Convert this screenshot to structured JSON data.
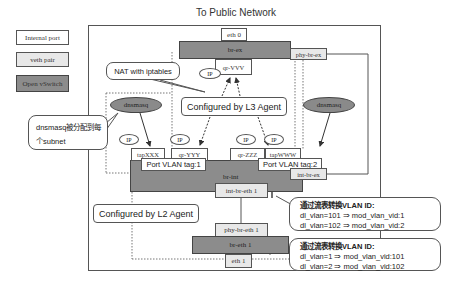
{
  "title": "To Public Network",
  "legend": [
    {
      "label": "Internal   port",
      "kind": "internal"
    },
    {
      "label": "veth   pair",
      "kind": "veth"
    },
    {
      "label": "Open   vSwitch",
      "kind": "ovs"
    }
  ],
  "colors": {
    "ovs": "#8c8c8c",
    "veth": "#e8e8e8",
    "internal": "#ffffff",
    "line": "#555555"
  },
  "external": {
    "eth0": "eth 0",
    "br_ex": "br-ex",
    "phy_br_ex": "phy-br-ex",
    "qr_vvv": "qr-VVV",
    "ip_label": "IP"
  },
  "callouts": {
    "nat": "NAT with iptables",
    "dnsmasq": [
      "dnsmasq被分配到每",
      "个subnet"
    ],
    "l3_agent": "Configured by L3 Agent",
    "l2_agent": "Configured by L2 Agent",
    "vlan_in": {
      "heading": "通过流表转换VLAN ID:",
      "lines": [
        "dl_vlan=101 ⇒ mod_vlan_vid:1",
        "dl_vlan=102 ⇒ mod_vlan_vid:2"
      ]
    },
    "vlan_out": {
      "heading": "通过流表转换VLAN ID:",
      "lines": [
        "dl_vlan=1 ⇒ mod_vlan_vid:101",
        "dl_vlan=2 ⇒ mod_vlan_vid:102"
      ]
    }
  },
  "dnsmasq": {
    "left": "dnsmasq",
    "right": "dnsmasq"
  },
  "ports": {
    "tap_xxx": "tapXXX",
    "qr_yyy": "qr-YYY",
    "qr_zzz": "qr-ZZZ",
    "tap_www": "tapWWW",
    "ip": "IP"
  },
  "br_int": {
    "label": "br-int",
    "vlan_tag_1": "Port VLAN tag:1",
    "vlan_tag_2": "Port VLAN tag:2",
    "int_br_ex": "int-br-ex",
    "int_br_eth1": "int-br-eth 1"
  },
  "br_eth1": {
    "phy_br_eth1": "phy-br-eth 1",
    "label": "br-eth 1",
    "eth1": "eth 1"
  }
}
